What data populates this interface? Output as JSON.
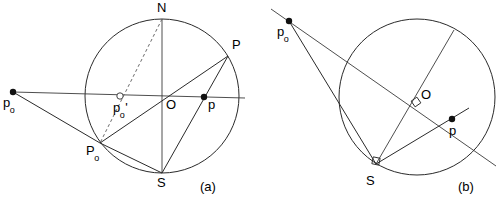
{
  "figure": {
    "type": "geometry-diagram",
    "background_color": "#ffffff",
    "line_color": "#2a2a2a",
    "point_color": "#111111"
  },
  "panels": [
    {
      "id": "a",
      "tag": "(a)",
      "tag_pos": {
        "x": 200,
        "y": 180
      },
      "circle": {
        "cx": 162,
        "cy": 96,
        "r": 77
      },
      "points": [
        {
          "name": "N",
          "label": "N",
          "x": 162,
          "y": 19,
          "marker": "none",
          "label_x": 157,
          "label_y": 1
        },
        {
          "name": "S",
          "label": "S",
          "x": 162,
          "y": 173,
          "marker": "none",
          "label_x": 157,
          "label_y": 176
        },
        {
          "name": "O",
          "label": "O",
          "x": 162,
          "y": 96,
          "marker": "none",
          "label_x": 166,
          "label_y": 98
        },
        {
          "name": "P",
          "label": "P",
          "x": 228,
          "y": 56,
          "marker": "none",
          "label_x": 232,
          "label_y": 38
        },
        {
          "name": "P0",
          "label": "P",
          "sub": "o",
          "x": 100,
          "y": 143,
          "marker": "none",
          "label_x": 86,
          "label_y": 144
        },
        {
          "name": "p",
          "label": "p",
          "x": 204,
          "y": 97,
          "marker": "dot",
          "label_x": 208,
          "label_y": 98
        },
        {
          "name": "p0",
          "label": "p",
          "sub": "o",
          "x": 13,
          "y": 92,
          "marker": "dot",
          "label_x": 3,
          "label_y": 96
        },
        {
          "name": "p0prime",
          "label": "p",
          "sub": "o",
          "prime": "'",
          "x": 120,
          "y": 96,
          "marker": "open",
          "label_x": 113,
          "label_y": 101
        }
      ],
      "segments": [
        {
          "name": "axis-horizontal",
          "x1": 13,
          "y1": 92,
          "x2": 245,
          "y2": 98
        },
        {
          "name": "axis-vertical-NS",
          "x1": 162,
          "y1": 19,
          "x2": 162,
          "y2": 173
        },
        {
          "name": "chord-p0-P0",
          "x1": 13,
          "y1": 92,
          "x2": 100,
          "y2": 143
        },
        {
          "name": "ray-P0-O-P",
          "x1": 100,
          "y1": 143,
          "x2": 228,
          "y2": 56
        },
        {
          "name": "chord-P0-S",
          "x1": 100,
          "y1": 143,
          "x2": 162,
          "y2": 173
        },
        {
          "name": "chord-P-S",
          "x1": 228,
          "y1": 56,
          "x2": 162,
          "y2": 173
        }
      ],
      "dashed_segments": [
        {
          "name": "dashed-N-P0",
          "x1": 162,
          "y1": 19,
          "x2": 100,
          "y2": 143
        }
      ]
    },
    {
      "id": "b",
      "tag": "(b)",
      "tag_pos": {
        "x": 458,
        "y": 180
      },
      "circle": {
        "cx": 417,
        "cy": 97,
        "r": 78
      },
      "points": [
        {
          "name": "O",
          "label": "O",
          "x": 417,
          "y": 97,
          "marker": "none",
          "label_x": 421,
          "label_y": 88
        },
        {
          "name": "S",
          "label": "S",
          "x": 376,
          "y": 164,
          "marker": "none",
          "label_x": 366,
          "label_y": 174
        },
        {
          "name": "p",
          "label": "p",
          "x": 452,
          "y": 119,
          "marker": "dot",
          "label_x": 449,
          "label_y": 124
        },
        {
          "name": "p0",
          "label": "p",
          "sub": "o",
          "x": 289,
          "y": 21,
          "marker": "dot",
          "label_x": 277,
          "label_y": 25
        }
      ],
      "segments": [
        {
          "name": "secant-through-O",
          "x1": 271,
          "y1": 9,
          "x2": 496,
          "y2": 166
        },
        {
          "name": "diameter-S-to-rim",
          "x1": 376,
          "y1": 164,
          "x2": 454,
          "y2": 30
        },
        {
          "name": "chord-p0-to-S",
          "x1": 289,
          "y1": 21,
          "x2": 376,
          "y2": 164
        },
        {
          "name": "chord-S-to-p-side",
          "x1": 376,
          "y1": 164,
          "x2": 469,
          "y2": 108
        }
      ],
      "right_angle_marks": [
        {
          "name": "right-angle-at-O",
          "x": 417,
          "y": 97
        },
        {
          "name": "right-angle-at-S",
          "x": 376,
          "y": 164
        }
      ]
    }
  ]
}
